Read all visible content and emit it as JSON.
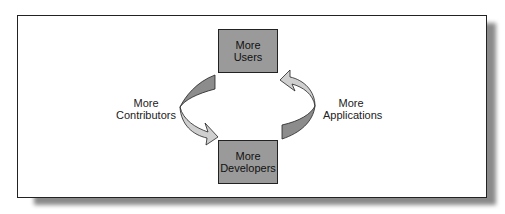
{
  "diagram": {
    "type": "cycle",
    "nodes": [
      {
        "id": "users",
        "line1": "More",
        "line2": "Users"
      },
      {
        "id": "developers",
        "line1": "More",
        "line2": "Developers"
      }
    ],
    "edges": [
      {
        "from": "users",
        "to": "developers",
        "line1": "More",
        "line2": "Contributors",
        "side": "left"
      },
      {
        "from": "developers",
        "to": "users",
        "line1": "More",
        "line2": "Applications",
        "side": "right"
      }
    ]
  },
  "colors": {
    "box_fill": "#9a9a9a",
    "arrow_dark": "#8c8c8c",
    "arrow_light": "#cfcfcf",
    "frame_border": "#222222",
    "shadow": "#8a8a8a"
  }
}
